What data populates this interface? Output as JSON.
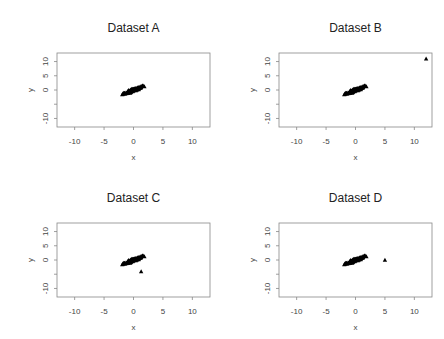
{
  "chart_data": [
    {
      "type": "scatter",
      "title": "Dataset A",
      "xlabel": "x",
      "ylabel": "y",
      "xlim": [
        -13,
        13
      ],
      "ylim": [
        -13,
        13
      ],
      "xticks": [
        -10,
        -5,
        0,
        5,
        10
      ],
      "yticks": [
        -10,
        -5,
        0,
        5,
        10
      ],
      "ytick_labels": [
        "-10",
        "",
        "0",
        "5",
        "10"
      ],
      "marker": "triangle",
      "cluster": {
        "center": [
          0,
          0
        ],
        "n": 100,
        "x_range": [
          -2,
          2.4
        ],
        "y_range": [
          -2.5,
          2
        ],
        "correlation": "positive"
      },
      "outliers": []
    },
    {
      "type": "scatter",
      "title": "Dataset B",
      "xlabel": "x",
      "ylabel": "y",
      "xlim": [
        -13,
        13
      ],
      "ylim": [
        -13,
        13
      ],
      "xticks": [
        -10,
        -5,
        0,
        5,
        10
      ],
      "yticks": [
        -10,
        -5,
        0,
        5,
        10
      ],
      "ytick_labels": [
        "-10",
        "",
        "0",
        "5",
        "10"
      ],
      "marker": "triangle",
      "cluster": {
        "center": [
          0,
          0
        ],
        "n": 100,
        "x_range": [
          -2,
          2.4
        ],
        "y_range": [
          -2.5,
          2
        ],
        "correlation": "positive"
      },
      "outliers": [
        [
          12,
          11
        ]
      ]
    },
    {
      "type": "scatter",
      "title": "Dataset C",
      "xlabel": "x",
      "ylabel": "y",
      "xlim": [
        -13,
        13
      ],
      "ylim": [
        -13,
        13
      ],
      "xticks": [
        -10,
        -5,
        0,
        5,
        10
      ],
      "yticks": [
        -10,
        -5,
        0,
        5,
        10
      ],
      "ytick_labels": [
        "-10",
        "",
        "0",
        "5",
        "10"
      ],
      "marker": "triangle",
      "cluster": {
        "center": [
          0,
          0
        ],
        "n": 100,
        "x_range": [
          -2,
          2.4
        ],
        "y_range": [
          -2.5,
          2
        ],
        "correlation": "positive"
      },
      "outliers": [
        [
          1.3,
          -4
        ]
      ]
    },
    {
      "type": "scatter",
      "title": "Dataset D",
      "xlabel": "x",
      "ylabel": "y",
      "xlim": [
        -13,
        13
      ],
      "ylim": [
        -13,
        13
      ],
      "xticks": [
        -10,
        -5,
        0,
        5,
        10
      ],
      "yticks": [
        -10,
        -5,
        0,
        5,
        10
      ],
      "ytick_labels": [
        "-10",
        "",
        "0",
        "5",
        "10"
      ],
      "marker": "triangle",
      "cluster": {
        "center": [
          0,
          0
        ],
        "n": 100,
        "x_range": [
          -2,
          2.4
        ],
        "y_range": [
          -2.5,
          2
        ],
        "correlation": "positive"
      },
      "outliers": [
        [
          5,
          0
        ]
      ]
    }
  ]
}
